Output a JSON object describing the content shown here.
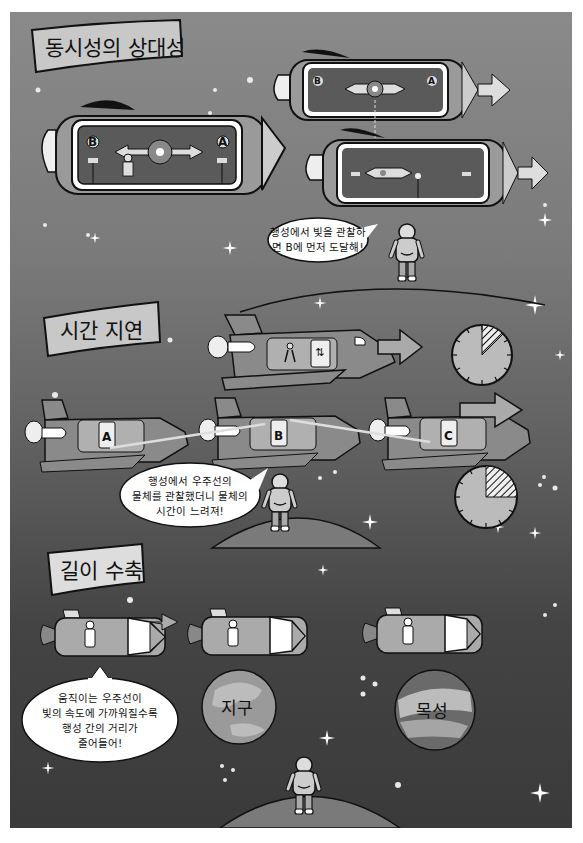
{
  "sections": [
    {
      "title": "동시성의 상대성",
      "labels": {
        "a": "A",
        "b": "B"
      },
      "bubble": {
        "lines": [
          "행성에서 빛을 관찰하",
          "면 B에 먼저 도달해!"
        ]
      }
    },
    {
      "title": "시간 지연",
      "labels": [
        "A",
        "B",
        "C"
      ],
      "bubble": {
        "lines": [
          "행성에서 우주선의",
          "물체를 관찰했더니 물체의",
          "시간이 느려져!"
        ]
      }
    },
    {
      "title": "길이 수축",
      "planets": [
        "지구",
        "목성"
      ],
      "bubble": {
        "lines": [
          "움직이는 우주선이",
          "빛의 속도에 가까워질수록",
          "행성 간의 거리가",
          "줄어들어!"
        ]
      }
    }
  ],
  "colors": {
    "background_top": "#8a8a8a",
    "background_bottom": "#3a3a3a",
    "banner_fill": "#c8c8c8",
    "ship_body": "#8c8c8c",
    "ship_window": "#5a5a5a",
    "planet_fill": "#8f8f8f"
  }
}
